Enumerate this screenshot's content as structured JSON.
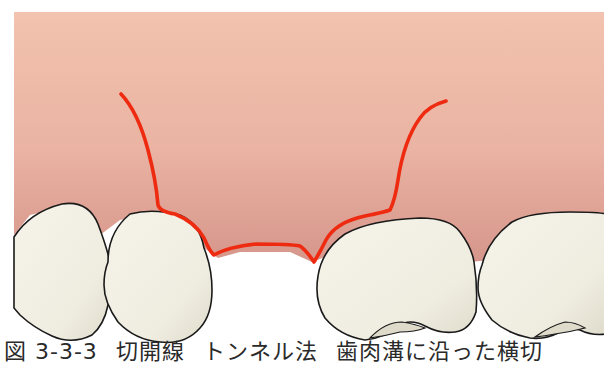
{
  "figure": {
    "colors": {
      "gingiva_top": "#f2c2ae",
      "gingiva_bottom": "#d99a8e",
      "incision_line": "#ee2a10",
      "tooth_fill": "#f3f1e6",
      "tooth_shadow": "#dcdacb",
      "outline": "#1a1a1a",
      "background": "#ffffff"
    },
    "elements": {
      "gingiva": "gingiva-region",
      "incision": "incision-line",
      "teeth": [
        "tooth-1",
        "tooth-2",
        "tooth-3",
        "tooth-4"
      ]
    }
  },
  "caption": {
    "figure_number": "図 3-3-3",
    "part_a": "切開線",
    "part_b": "トンネル法",
    "part_c": "歯肉溝に沿った横切"
  }
}
